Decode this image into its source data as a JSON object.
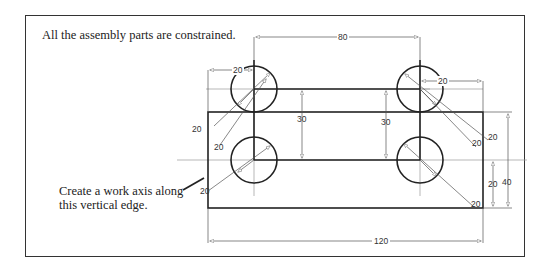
{
  "captions": {
    "top": "All the assembly parts are constrained.",
    "bottom_line1": "Create a work axis along",
    "bottom_line2": "this vertical edge."
  },
  "dimensions": {
    "top_spacing": "80",
    "overall_width": "120",
    "overall_height": "40",
    "lower_offset": "20",
    "tab_height_left": "30",
    "tab_height_mid": "30",
    "top_left_offset": "20",
    "top_right_offset": "20",
    "ul_diameter_1": "20",
    "ul_diameter_2": "20",
    "ur_diameter_1": "20",
    "ur_diameter_2": "20",
    "ll_diameter": "20",
    "lr_diameter": "20"
  },
  "colors": {
    "outline": "#222222",
    "dimension": "#555555",
    "centerline": "#999999"
  }
}
